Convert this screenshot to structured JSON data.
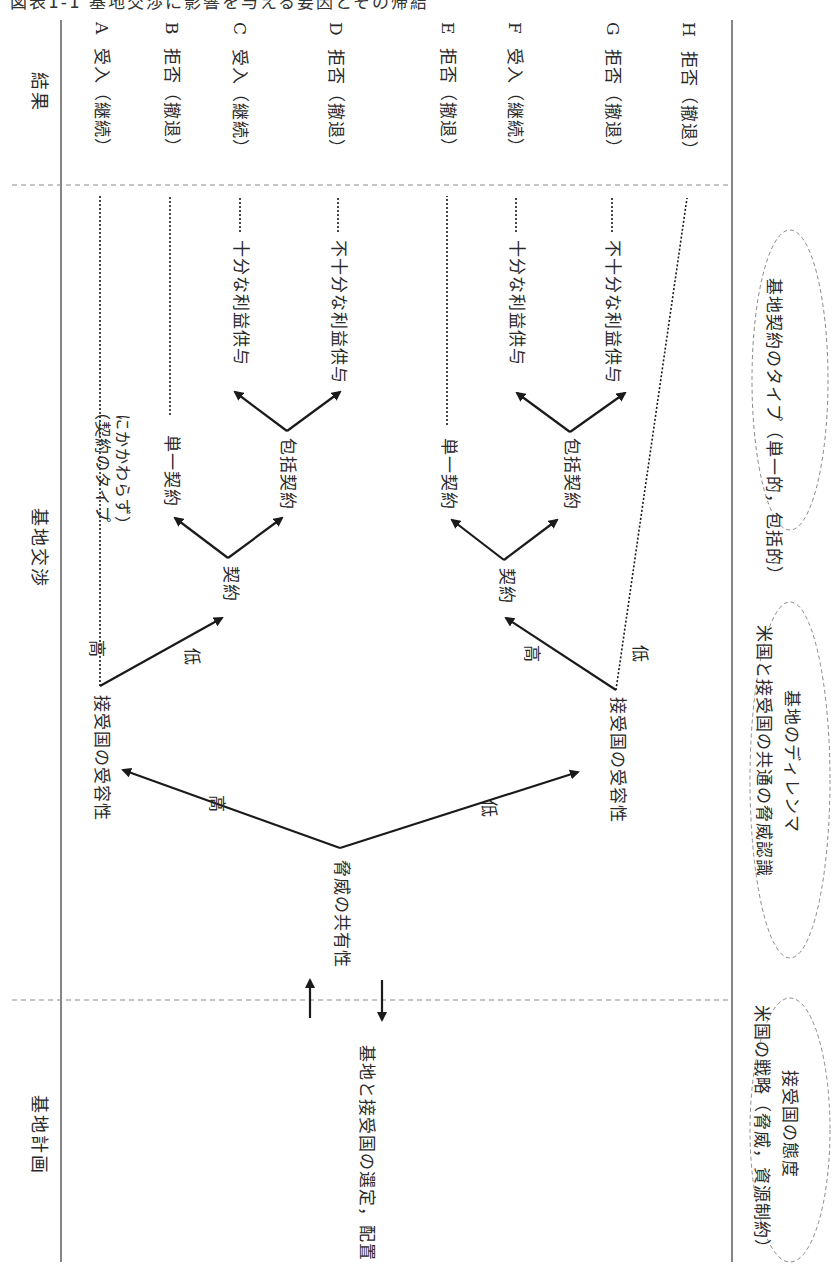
{
  "caption": "図表1-1 基地交渉に影響を与える要因とその帰結",
  "headers": {
    "results": "結果",
    "negotiation": "基地交渉",
    "planning": "基地計画"
  },
  "results": [
    {
      "id": "A",
      "label": "受入（継続）",
      "letter": "A"
    },
    {
      "id": "B",
      "label": "拒否（撤退）",
      "letter": "B"
    },
    {
      "id": "C",
      "label": "受入（継続）",
      "letter": "C"
    },
    {
      "id": "D",
      "label": "拒否（撤退）",
      "letter": "D"
    },
    {
      "id": "E",
      "label": "拒否（撤退）",
      "letter": "E"
    },
    {
      "id": "F",
      "label": "受入（継続）",
      "letter": "F"
    },
    {
      "id": "G",
      "label": "拒否（撤退）",
      "letter": "G"
    },
    {
      "id": "H",
      "label": "拒否（撤退）",
      "letter": "H"
    }
  ],
  "nodes": {
    "planning_node": "基地と接受国の選定，配置",
    "threat_sharing": "脅威の共有性",
    "acceptability_high": "接受国の受容性",
    "acceptability_low": "接受国の受容性",
    "contract_upper": "契約",
    "contract_lower": "契約",
    "single_upper": "単一契約",
    "comprehensive_upper": "包括契約",
    "single_lower": "単一契約",
    "comprehensive_lower": "包括契約",
    "sufficient_upper": "十分な利益供与",
    "insufficient_upper": "不十分な利益供与",
    "sufficient_lower": "十分な利益供与",
    "insufficient_lower": "不十分な利益供与",
    "regardless_line1": "（契約のタイプ",
    "regardless_line2": "にかかわらず）"
  },
  "edge_labels": {
    "threat_high": "高",
    "threat_low": "低",
    "upper_acc_high": "高",
    "upper_acc_low": "低",
    "lower_acc_high": "高",
    "lower_acc_low": "低"
  },
  "factors": {
    "planning": {
      "line1": "米国の戦略（脅威，資源制約）",
      "line2": "接受国の態度"
    },
    "negotiation": {
      "line1": "米国と接受国の共通の脅威認識",
      "line2": "基地のディレンマ"
    },
    "contract": {
      "line1": "基地契約のタイプ（単一的，包括的）"
    }
  },
  "colors": {
    "line": "#1a1a1a",
    "dashed": "#8a8a8a",
    "text": "#2a2a2a"
  }
}
